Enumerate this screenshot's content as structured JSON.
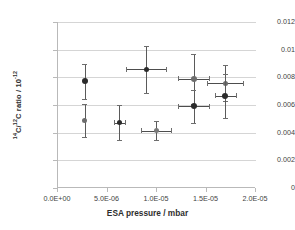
{
  "chart_data": {
    "type": "scatter",
    "title": "",
    "xlabel": "ESA pressure / mbar",
    "ylabel": "14C/12C ratio / 10-12",
    "ylabel_parts": {
      "sup1": "14",
      "mid1": "C/",
      "sup2": "12",
      "mid2": "C ratio / 10",
      "sup3": "-12"
    },
    "xlim": [
      0.0,
      2e-05
    ],
    "ylim": [
      0.0,
      0.012
    ],
    "grid": true,
    "legend": "none",
    "xticks": [
      0.0,
      5e-06,
      1e-05,
      1.5e-05,
      2e-05
    ],
    "xtick_labels": [
      "0.0E+00",
      "5.0E-06",
      "1.0E-05",
      "1.5E-05",
      "2.0E-05"
    ],
    "yticks": [
      0,
      0.002,
      0.004,
      0.006,
      0.008,
      0.01,
      0.012
    ],
    "ytick_labels": [
      "0",
      "0.002",
      "0.004",
      "0.006",
      "0.008",
      "0.01",
      "0.012"
    ],
    "points": [
      {
        "x": 2.8e-06,
        "y": 0.0077,
        "xerr": 0.0,
        "yerr": 0.00128,
        "marker_size": 6,
        "marker_color": "#2b2b2b"
      },
      {
        "x": 2.8e-06,
        "y": 0.0049,
        "xerr": 0.0,
        "yerr": 0.0012,
        "marker_size": 5,
        "marker_color": "#6d6d6d"
      },
      {
        "x": 6.3e-06,
        "y": 0.00473,
        "xerr": 5.5e-07,
        "yerr": 0.00127,
        "marker_size": 5,
        "marker_color": "#2b2b2b"
      },
      {
        "x": 9e-06,
        "y": 0.00858,
        "xerr": 2e-06,
        "yerr": 0.00172,
        "marker_size": 5,
        "marker_color": "#2b2b2b"
      },
      {
        "x": 1e-05,
        "y": 0.00415,
        "xerr": 1.55e-06,
        "yerr": 0.0007,
        "marker_size": 5,
        "marker_color": "#7a7a7a"
      },
      {
        "x": 1.38e-05,
        "y": 0.0079,
        "xerr": 1.55e-06,
        "yerr": 0.0018,
        "marker_size": 6,
        "marker_color": "#6d6d6d"
      },
      {
        "x": 1.38e-05,
        "y": 0.0059,
        "xerr": 1.55e-06,
        "yerr": 0.00122,
        "marker_size": 6,
        "marker_color": "#2b2b2b"
      },
      {
        "x": 1.7e-05,
        "y": 0.00758,
        "xerr": 1.8e-06,
        "yerr": 0.0013,
        "marker_size": 5,
        "marker_color": "#6d6d6d"
      },
      {
        "x": 1.7e-05,
        "y": 0.00667,
        "xerr": 1.05e-06,
        "yerr": 0.00158,
        "marker_size": 6,
        "marker_color": "#2b2b2b"
      }
    ],
    "colors": {
      "gridline": "#d5d5d5",
      "axis": "#b9b9b9",
      "text": "#3f3f3f",
      "marker_dark": "#2b2b2b",
      "marker_light": "#6d6d6d"
    }
  }
}
